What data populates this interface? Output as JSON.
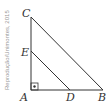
{
  "credit": "Reprodução/Unimontes, 2015",
  "points": {
    "A": {
      "label": "A",
      "x": 31,
      "y": 90
    },
    "B": {
      "label": "B",
      "x": 103,
      "y": 90
    },
    "C": {
      "label": "C",
      "x": 31,
      "y": 17
    },
    "D": {
      "label": "D",
      "x": 70,
      "y": 90
    },
    "E": {
      "label": "E",
      "x": 31,
      "y": 51
    }
  },
  "right_angle_at": "A",
  "segments": [
    "AB",
    "AC",
    "CB",
    "ED"
  ],
  "colors": {
    "line": "#333333",
    "credit": "#999999"
  }
}
